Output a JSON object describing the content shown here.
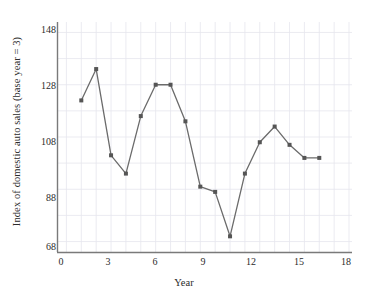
{
  "chart_data": {
    "type": "line",
    "title": "",
    "xlabel": "Year",
    "ylabel": "Index of domestic auto sales (base year = 3)",
    "xlim": [
      -0.6,
      19.2
    ],
    "ylim": [
      64,
      152
    ],
    "xticks": [
      "0",
      "3",
      "6",
      "9",
      "12",
      "15",
      "18"
    ],
    "xtick_values": [
      0,
      3,
      6,
      9,
      12,
      15,
      18
    ],
    "yticks": [
      "68",
      "88",
      "108",
      "128",
      "148"
    ],
    "ytick_values": [
      68,
      88,
      108,
      128,
      148
    ],
    "grid": true,
    "grid_color": "#e6e6ee",
    "legend": "none",
    "line_color": "#6b6b6b",
    "marker_color": "#555555",
    "marker": "square",
    "x": [
      1,
      2,
      3,
      4,
      5,
      6,
      7,
      8,
      9,
      10,
      11,
      12,
      13,
      14,
      15,
      16,
      17
    ],
    "values": [
      122,
      134,
      101,
      94,
      116,
      128,
      128,
      114,
      89,
      87,
      70,
      94,
      106,
      112,
      105,
      100,
      100
    ],
    "series": [
      {
        "name": "Index of domestic auto sales",
        "values": [
          122,
          134,
          101,
          94,
          116,
          128,
          128,
          114,
          89,
          87,
          70,
          94,
          106,
          112,
          105,
          100,
          100
        ]
      }
    ]
  },
  "axes": {
    "y_title": "Index of domestic auto sales (base year = 3)",
    "x_title": "Year"
  }
}
